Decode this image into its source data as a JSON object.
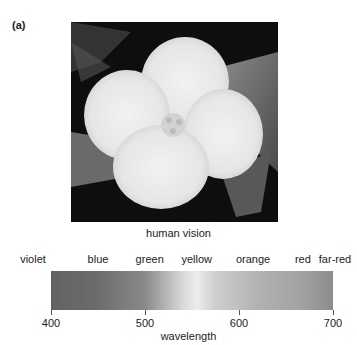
{
  "figure": {
    "panel_label": "(a)",
    "photo_description": "black-and-white photo of a four-petaled white flower on dark leaves",
    "caption": "human vision"
  },
  "spectrum": {
    "color_labels": [
      {
        "label": "violet",
        "wavelength": 410
      },
      {
        "label": "blue",
        "wavelength": 450
      },
      {
        "label": "green",
        "wavelength": 505
      },
      {
        "label": "yellow",
        "wavelength": 555
      },
      {
        "label": "orange",
        "wavelength": 615
      },
      {
        "label": "red",
        "wavelength": 668
      },
      {
        "label": "far-red",
        "wavelength": 700
      }
    ],
    "axis": {
      "title": "wavelength",
      "min": 400,
      "max": 700,
      "ticks": [
        {
          "value": 400,
          "label": "400"
        },
        {
          "value": 500,
          "label": "500"
        },
        {
          "value": 600,
          "label": "600"
        },
        {
          "value": 700,
          "label": "700"
        }
      ]
    },
    "gradient_stops": [
      {
        "wavelength": 400,
        "color": "#626262"
      },
      {
        "wavelength": 450,
        "color": "#6c6c6c"
      },
      {
        "wavelength": 500,
        "color": "#8a8a8a"
      },
      {
        "wavelength": 540,
        "color": "#d8d8d8"
      },
      {
        "wavelength": 555,
        "color": "#ececec"
      },
      {
        "wavelength": 575,
        "color": "#cfcfcf"
      },
      {
        "wavelength": 620,
        "color": "#b2b2b2"
      },
      {
        "wavelength": 670,
        "color": "#a0a0a0"
      },
      {
        "wavelength": 700,
        "color": "#8c8c8c"
      }
    ]
  }
}
